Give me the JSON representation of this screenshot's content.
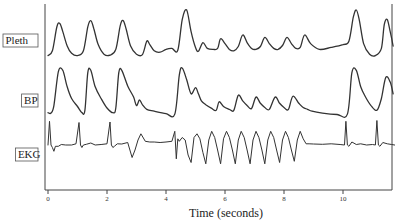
{
  "chart_data": {
    "type": "line",
    "title": "",
    "xlabel": "Time (seconds)",
    "ylabel": "",
    "xlim": [
      0,
      11.8
    ],
    "xticks": [
      0,
      2,
      4,
      6,
      8,
      10
    ],
    "xtick_labels": [
      "0",
      "2",
      "4",
      "6",
      "8",
      "10"
    ],
    "grid": false,
    "legend": "none",
    "series": [
      {
        "name": "Pleth",
        "label": "Pleth",
        "units": "normalized (0-1)",
        "x": [
          0.0,
          0.15,
          0.3,
          0.4,
          0.5,
          0.65,
          0.8,
          1.0,
          1.2,
          1.35,
          1.45,
          1.55,
          1.7,
          1.9,
          2.1,
          2.3,
          2.45,
          2.55,
          2.65,
          2.8,
          3.0,
          3.2,
          3.35,
          3.45,
          3.6,
          3.8,
          4.0,
          4.2,
          4.4,
          4.55,
          4.7,
          4.85,
          5.0,
          5.1,
          5.25,
          5.4,
          5.6,
          5.75,
          5.85,
          6.0,
          6.15,
          6.3,
          6.45,
          6.6,
          6.75,
          6.9,
          7.05,
          7.2,
          7.35,
          7.5,
          7.65,
          7.8,
          7.95,
          8.1,
          8.25,
          8.4,
          8.55,
          8.7,
          8.9,
          9.2,
          9.6,
          10.0,
          10.2,
          10.35,
          10.45,
          10.55,
          10.7,
          10.9,
          11.1,
          11.3,
          11.4,
          11.5,
          11.6,
          11.7
        ],
        "y": [
          0.05,
          0.15,
          0.65,
          0.72,
          0.55,
          0.25,
          0.1,
          0.05,
          0.15,
          0.65,
          0.78,
          0.62,
          0.28,
          0.08,
          0.06,
          0.18,
          0.68,
          0.78,
          0.6,
          0.25,
          0.08,
          0.07,
          0.35,
          0.28,
          0.15,
          0.12,
          0.18,
          0.2,
          0.16,
          0.8,
          1.0,
          0.55,
          0.22,
          0.14,
          0.32,
          0.2,
          0.18,
          0.2,
          0.4,
          0.3,
          0.18,
          0.15,
          0.24,
          0.48,
          0.32,
          0.2,
          0.18,
          0.24,
          0.43,
          0.3,
          0.2,
          0.18,
          0.26,
          0.43,
          0.3,
          0.2,
          0.22,
          0.48,
          0.3,
          0.18,
          0.22,
          0.28,
          0.35,
          0.85,
          1.0,
          0.8,
          0.3,
          0.08,
          0.05,
          0.2,
          0.7,
          0.8,
          0.55,
          0.25
        ],
        "color": "#333333"
      },
      {
        "name": "BP",
        "label": "BP",
        "units": "normalized (0-1)",
        "x": [
          0.0,
          0.1,
          0.2,
          0.35,
          0.5,
          0.65,
          0.8,
          1.0,
          1.15,
          1.25,
          1.35,
          1.45,
          1.6,
          1.8,
          2.0,
          2.2,
          2.3,
          2.4,
          2.5,
          2.7,
          2.9,
          3.0,
          3.1,
          3.2,
          3.35,
          3.6,
          4.0,
          4.3,
          4.45,
          4.55,
          4.7,
          4.85,
          5.0,
          5.1,
          5.2,
          5.35,
          5.55,
          5.7,
          5.8,
          5.95,
          6.15,
          6.3,
          6.45,
          6.6,
          6.75,
          6.9,
          7.05,
          7.2,
          7.35,
          7.5,
          7.7,
          7.85,
          8.0,
          8.15,
          8.3,
          8.5,
          8.65,
          8.8,
          8.95,
          9.3,
          9.8,
          10.15,
          10.3,
          10.45,
          10.6,
          10.75,
          10.95,
          11.15,
          11.3,
          11.45,
          11.6,
          11.7
        ],
        "y": [
          0.05,
          0.04,
          0.2,
          0.92,
          0.95,
          0.6,
          0.35,
          0.18,
          0.05,
          0.1,
          0.9,
          0.95,
          0.6,
          0.35,
          0.15,
          0.05,
          0.15,
          0.9,
          0.95,
          0.62,
          0.38,
          0.2,
          0.32,
          0.22,
          0.12,
          0.08,
          0.03,
          0.02,
          0.85,
          1.0,
          0.75,
          0.45,
          0.58,
          0.45,
          0.3,
          0.22,
          0.14,
          0.1,
          0.28,
          0.18,
          0.12,
          0.1,
          0.42,
          0.3,
          0.2,
          0.14,
          0.38,
          0.25,
          0.16,
          0.12,
          0.38,
          0.25,
          0.16,
          0.12,
          0.4,
          0.25,
          0.16,
          0.12,
          0.08,
          0.04,
          0.01,
          0.02,
          0.9,
          0.95,
          0.6,
          0.4,
          0.2,
          0.1,
          0.35,
          0.8,
          0.7,
          0.45
        ],
        "color": "#333333"
      },
      {
        "name": "EKG",
        "label": "EKG",
        "units": "normalized (-1 to 1)",
        "x": [
          0.0,
          0.05,
          0.1,
          0.15,
          0.2,
          0.25,
          0.35,
          0.45,
          0.6,
          0.8,
          0.95,
          1.05,
          1.1,
          1.15,
          1.2,
          1.3,
          1.45,
          1.6,
          1.8,
          2.0,
          2.1,
          2.15,
          2.2,
          2.25,
          2.35,
          2.5,
          2.7,
          2.85,
          2.95,
          3.05,
          3.15,
          3.3,
          3.45,
          3.6,
          3.8,
          4.0,
          4.2,
          4.3,
          4.35,
          4.4,
          4.45,
          4.55,
          4.65,
          4.75,
          4.85,
          4.95,
          5.05,
          5.15,
          5.25,
          5.35,
          5.45,
          5.55,
          5.65,
          5.75,
          5.85,
          5.95,
          6.05,
          6.15,
          6.25,
          6.35,
          6.45,
          6.55,
          6.65,
          6.75,
          6.85,
          6.95,
          7.05,
          7.15,
          7.25,
          7.35,
          7.45,
          7.55,
          7.65,
          7.75,
          7.85,
          7.95,
          8.05,
          8.15,
          8.25,
          8.35,
          8.45,
          8.55,
          8.65,
          8.75,
          8.85,
          9.0,
          9.3,
          9.6,
          9.9,
          10.05,
          10.1,
          10.15,
          10.2,
          10.3,
          10.45,
          10.6,
          10.8,
          11.0,
          11.1,
          11.15,
          11.2,
          11.25,
          11.35,
          11.5,
          11.65,
          11.75
        ],
        "y": [
          0.0,
          0.95,
          0.0,
          -0.1,
          -0.25,
          -0.05,
          -0.05,
          0.02,
          0.0,
          0.0,
          0.05,
          0.9,
          0.0,
          -0.1,
          0.0,
          0.03,
          0.08,
          0.0,
          0.02,
          0.05,
          0.92,
          0.0,
          -0.1,
          -0.05,
          0.05,
          0.04,
          0.1,
          -0.5,
          -0.2,
          0.2,
          0.45,
          0.15,
          0.12,
          0.12,
          0.1,
          0.12,
          0.15,
          0.55,
          -0.55,
          0.25,
          0.15,
          0.3,
          0.2,
          -0.4,
          -0.7,
          0.3,
          0.45,
          0.25,
          -0.3,
          -0.75,
          0.2,
          0.55,
          0.3,
          -0.2,
          -0.75,
          0.25,
          0.55,
          0.3,
          -0.2,
          -0.75,
          0.2,
          0.55,
          0.3,
          -0.2,
          -0.75,
          0.2,
          0.55,
          0.3,
          -0.2,
          -0.75,
          0.2,
          0.55,
          0.3,
          -0.2,
          -0.7,
          0.2,
          0.55,
          0.3,
          -0.2,
          -0.65,
          0.2,
          0.55,
          0.25,
          0.05,
          0.05,
          0.04,
          0.03,
          0.05,
          0.02,
          0.0,
          0.95,
          0.0,
          -0.05,
          0.12,
          0.02,
          0.05,
          0.0,
          0.02,
          0.0,
          0.98,
          0.0,
          -0.05,
          0.1,
          0.05,
          0.02,
          0.0
        ],
        "color": "#333333"
      }
    ]
  }
}
